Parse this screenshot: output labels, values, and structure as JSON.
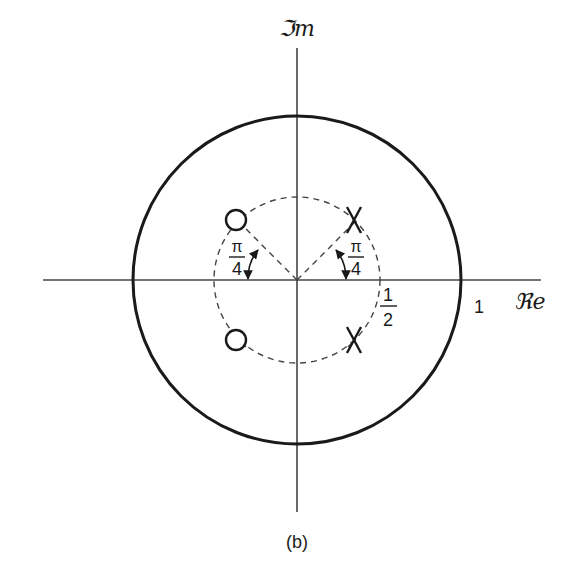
{
  "figure": {
    "caption": "(b)",
    "type": "pole-zero plot (z-plane)"
  },
  "axes": {
    "real_label": "ℜe",
    "imag_label": "ℑm"
  },
  "unit_circle": {
    "radius": 1,
    "label": "1"
  },
  "inner_circle": {
    "radius": 0.5,
    "label_num": "1",
    "label_den": "2",
    "style": "dashed"
  },
  "angles": [
    {
      "label_num": "π",
      "label_den": "4",
      "side": "left"
    },
    {
      "label_num": "π",
      "label_den": "4",
      "side": "right"
    }
  ],
  "zeros": [
    {
      "r": 0.5,
      "angle": "3π/4",
      "marker": "O"
    },
    {
      "r": 0.5,
      "angle": "-3π/4",
      "marker": "O"
    }
  ],
  "poles": [
    {
      "r": 0.5,
      "angle": "π/4",
      "marker": "X"
    },
    {
      "r": 0.5,
      "angle": "-π/4",
      "marker": "X"
    }
  ],
  "colors": {
    "ink": "#1a1a1a",
    "background": "#ffffff"
  }
}
